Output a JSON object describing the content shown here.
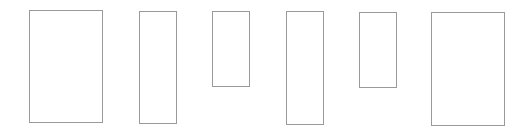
{
  "diagram": {
    "background": "#ffffff",
    "stroke_color": "#9a9a9a",
    "stroke_width": 1,
    "shapes": [
      {
        "id": "rect-1",
        "type": "rectangle",
        "x": 29,
        "y": 10,
        "width": 74,
        "height": 113,
        "label": ""
      },
      {
        "id": "rect-2",
        "type": "rectangle",
        "x": 139,
        "y": 11,
        "width": 38,
        "height": 113,
        "label": ""
      },
      {
        "id": "rect-3",
        "type": "rectangle",
        "x": 212,
        "y": 11,
        "width": 38,
        "height": 76,
        "label": ""
      },
      {
        "id": "rect-4",
        "type": "rectangle",
        "x": 286,
        "y": 11,
        "width": 38,
        "height": 114,
        "label": ""
      },
      {
        "id": "rect-5",
        "type": "rectangle",
        "x": 359,
        "y": 12,
        "width": 38,
        "height": 76,
        "label": ""
      },
      {
        "id": "rect-6",
        "type": "rectangle",
        "x": 431,
        "y": 12,
        "width": 74,
        "height": 114,
        "label": ""
      }
    ]
  }
}
